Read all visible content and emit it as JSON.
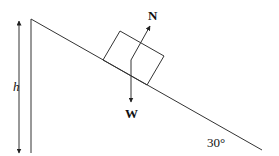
{
  "diagram": {
    "labels": {
      "height": "h",
      "normal_force": "N",
      "weight": "W",
      "angle": "30°"
    },
    "incline_angle_deg": 30,
    "colors": {
      "stroke": "#222222",
      "background": "#ffffff"
    }
  }
}
